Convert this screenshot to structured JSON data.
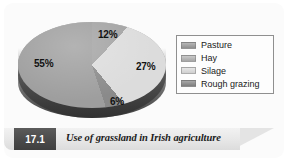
{
  "figure": {
    "number": "17.1",
    "caption": "Use of grassland in Irish agriculture"
  },
  "colors": {
    "pasture": "#9a9a9a",
    "hay": "#828282",
    "silage": "#d6d6d6",
    "rough_grazing": "#b4b4b4",
    "legend_border": "#8f8f8f",
    "caption_box": "#4a4a4a",
    "card_background": "#fbfbfb"
  },
  "legend": {
    "items": [
      {
        "label": "Pasture",
        "color": "#9a9a9a"
      },
      {
        "label": "Hay",
        "color": "#b0b0b0"
      },
      {
        "label": "Silage",
        "color": "#d6d6d6"
      },
      {
        "label": "Rough grazing",
        "color": "#8c8c8c"
      }
    ]
  },
  "labels": {
    "pasture_pct": "55%",
    "hay_pct": "12%",
    "silage_pct": "27%",
    "rough_grazing_pct": "6%"
  },
  "chart_data": {
    "type": "pie",
    "title": "Use of grassland in Irish agriculture",
    "categories": [
      "Pasture",
      "Hay",
      "Silage",
      "Rough grazing"
    ],
    "values": [
      55,
      12,
      27,
      6
    ],
    "unit": "%",
    "data_labels": [
      "55%",
      "12%",
      "27%",
      "6%"
    ],
    "colors": [
      "#9a9a9a",
      "#b0b0b0",
      "#d6d6d6",
      "#8c8c8c"
    ],
    "legend_position": "right",
    "grid": false,
    "style": "3d-pie",
    "xlabel": "",
    "ylabel": ""
  }
}
